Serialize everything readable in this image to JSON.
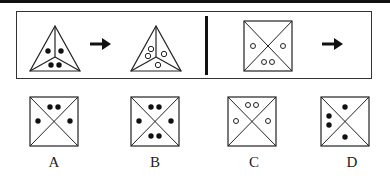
{
  "question": {
    "left_pair": {
      "shape": "triangle-3-sections",
      "start": {
        "dots": [
          {
            "section": "left",
            "count": 1,
            "fill": "black"
          },
          {
            "section": "right",
            "count": 1,
            "fill": "black"
          },
          {
            "section": "bottom",
            "count": 2,
            "fill": "black"
          }
        ]
      },
      "arrow": "right-arrow-icon",
      "result": {
        "dots": [
          {
            "section": "left",
            "count": 2,
            "fill": "white"
          },
          {
            "section": "right",
            "count": 1,
            "fill": "white"
          },
          {
            "section": "bottom",
            "count": 1,
            "fill": "white"
          }
        ]
      }
    },
    "right_pair": {
      "shape": "square-4-sections",
      "start": {
        "dots": [
          {
            "section": "left",
            "count": 1,
            "fill": "white"
          },
          {
            "section": "right",
            "count": 1,
            "fill": "white"
          },
          {
            "section": "bottom",
            "count": 2,
            "fill": "white"
          }
        ]
      },
      "arrow": "right-arrow-icon",
      "result": "?"
    }
  },
  "options": [
    {
      "label": "A",
      "dots": [
        {
          "section": "top",
          "count": 2,
          "fill": "black"
        },
        {
          "section": "left",
          "count": 1,
          "fill": "black"
        },
        {
          "section": "right",
          "count": 1,
          "fill": "black"
        }
      ]
    },
    {
      "label": "B",
      "dots": [
        {
          "section": "top",
          "count": 2,
          "fill": "black"
        },
        {
          "section": "left",
          "count": 1,
          "fill": "black"
        },
        {
          "section": "right",
          "count": 1,
          "fill": "black"
        },
        {
          "section": "bottom",
          "count": 2,
          "fill": "black"
        }
      ]
    },
    {
      "label": "C",
      "dots": [
        {
          "section": "top",
          "count": 2,
          "fill": "white"
        },
        {
          "section": "left",
          "count": 1,
          "fill": "white"
        },
        {
          "section": "right",
          "count": 1,
          "fill": "white"
        }
      ]
    },
    {
      "label": "D",
      "dots": [
        {
          "section": "top",
          "count": 1,
          "fill": "black"
        },
        {
          "section": "left",
          "count": 2,
          "fill": "black"
        },
        {
          "section": "bottom",
          "count": 1,
          "fill": "black"
        }
      ]
    }
  ]
}
